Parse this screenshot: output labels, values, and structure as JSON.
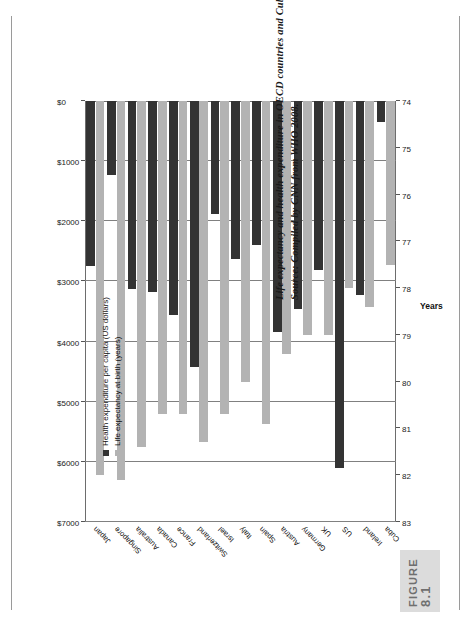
{
  "figure": {
    "badge_word": "FIGURE",
    "badge_number": "8.1",
    "caption_line1": "Life expectancy and health expenditure in OECD countries and Cuba, 2008",
    "caption_line2": "Source: Compiled by CNN from WHO 2008."
  },
  "legend": {
    "items": [
      {
        "label": "Health expenditure per capita (US dollars)",
        "color": "#333333",
        "key": "money"
      },
      {
        "label": "Life expectancy at birth (years)",
        "color": "#b3b3b3",
        "key": "years"
      }
    ]
  },
  "axes": {
    "money_axis_title": "",
    "years_axis_title": "Years",
    "money_ticks": [
      "$0",
      "$1000",
      "$2000",
      "$3000",
      "$4000",
      "$5000",
      "$6000",
      "$7000"
    ],
    "years_ticks": [
      "74",
      "75",
      "76",
      "77",
      "78",
      "79",
      "80",
      "81",
      "82",
      "83"
    ]
  },
  "chart_data": {
    "type": "bar",
    "orientation": "vertical-printed-sideways",
    "title": "Life expectancy and health expenditure in OECD countries and Cuba, 2008",
    "subtitle": "Source: Compiled by CNN from WHO 2008.",
    "xlabel": "",
    "ylabel": "Years",
    "y2label": "Health expenditure per capita (US dollars)",
    "grid": true,
    "legend_position": "inside-top-left",
    "categories": [
      "Japan",
      "Singapore",
      "Australia",
      "Canada",
      "France",
      "Switzerland",
      "Israel",
      "Italy",
      "Spain",
      "Austria",
      "Germany",
      "UK",
      "US",
      "Ireland",
      "Cuba"
    ],
    "series": [
      {
        "name": "Health expenditure per capita (US dollars)",
        "color": "#333333",
        "axis": "money",
        "ylim": [
          0,
          7000
        ],
        "values": [
          2751,
          1228,
          3122,
          3173,
          3554,
          4417,
          1885,
          2623,
          2388,
          3836,
          3465,
          2815,
          6096,
          3230,
          355
        ]
      },
      {
        "name": "Life expectancy at birth (years)",
        "color": "#b3b3b3",
        "axis": "years",
        "ylim": [
          74,
          83
        ],
        "values": [
          82.0,
          82.1,
          81.4,
          80.7,
          80.7,
          81.3,
          80.7,
          80.0,
          80.9,
          79.4,
          79.0,
          79.0,
          78.0,
          78.4,
          77.5
        ]
      }
    ]
  }
}
